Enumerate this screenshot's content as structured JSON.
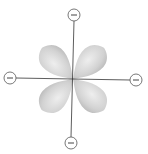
{
  "diagram": {
    "type": "d-orbital-ligand-field",
    "center": {
      "x": 73,
      "y": 79
    },
    "lobe_color": "#c8c8c8",
    "lobe_highlight": "#ececec",
    "axis_color": "#333333",
    "charge_stroke": "#555555",
    "charges": [
      {
        "id": "top",
        "x": 74,
        "y": 15,
        "sign": "−"
      },
      {
        "id": "left",
        "x": 10,
        "y": 78,
        "sign": "−"
      },
      {
        "id": "right",
        "x": 136,
        "y": 80,
        "sign": "−"
      },
      {
        "id": "bottom",
        "x": 71,
        "y": 143,
        "sign": "−"
      }
    ],
    "lobes": [
      {
        "id": "upper-left",
        "angle": -135
      },
      {
        "id": "upper-right",
        "angle": -45
      },
      {
        "id": "lower-left",
        "angle": 135
      },
      {
        "id": "lower-right",
        "angle": 45
      }
    ]
  }
}
